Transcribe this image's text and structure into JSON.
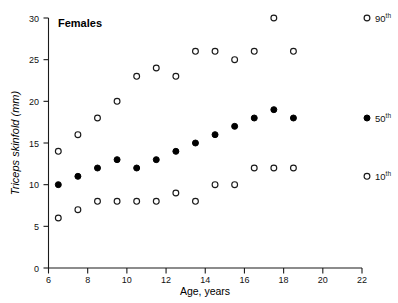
{
  "chart_data": {
    "type": "scatter",
    "title": "Females",
    "xlabel": "Age,  years",
    "ylabel": "Triceps  skinfold  (mm)",
    "xlim": [
      6,
      22
    ],
    "ylim": [
      0,
      30
    ],
    "xticks": [
      6,
      8,
      10,
      12,
      14,
      16,
      18,
      20,
      22
    ],
    "yticks": [
      0,
      5,
      10,
      15,
      20,
      25,
      30
    ],
    "grid": false,
    "legend_position": "right-outside",
    "x": [
      6.5,
      7.5,
      8.5,
      9.5,
      10.5,
      11.5,
      12.5,
      13.5,
      14.5,
      15.5,
      16.5,
      17.5,
      18.5
    ],
    "series": [
      {
        "name": "90th",
        "marker": "open-circle",
        "values": [
          14,
          16,
          18,
          20,
          23,
          24,
          23,
          26,
          26,
          25,
          26,
          30,
          26
        ]
      },
      {
        "name": "50th",
        "marker": "filled-circle",
        "values": [
          10,
          11,
          12,
          13,
          12,
          13,
          14,
          15,
          16,
          17,
          18,
          19,
          18
        ]
      },
      {
        "name": "10th",
        "marker": "open-circle",
        "values": [
          6,
          7,
          8,
          8,
          8,
          8,
          9,
          8,
          10,
          10,
          12,
          12,
          12
        ]
      }
    ],
    "legend": [
      {
        "label": "90",
        "suffix": "th",
        "marker": "open-circle",
        "value_at_legend": 30
      },
      {
        "label": "50",
        "suffix": "th",
        "marker": "filled-circle",
        "value_at_legend": 18
      },
      {
        "label": "10",
        "suffix": "th",
        "marker": "open-circle",
        "value_at_legend": 11
      }
    ],
    "colors": {
      "axis": "#1a1a1a",
      "marker_stroke": "#1a1a1a",
      "marker_fill_open": "#ffffff",
      "marker_fill_solid": "#000000",
      "background": "#ffffff"
    }
  }
}
